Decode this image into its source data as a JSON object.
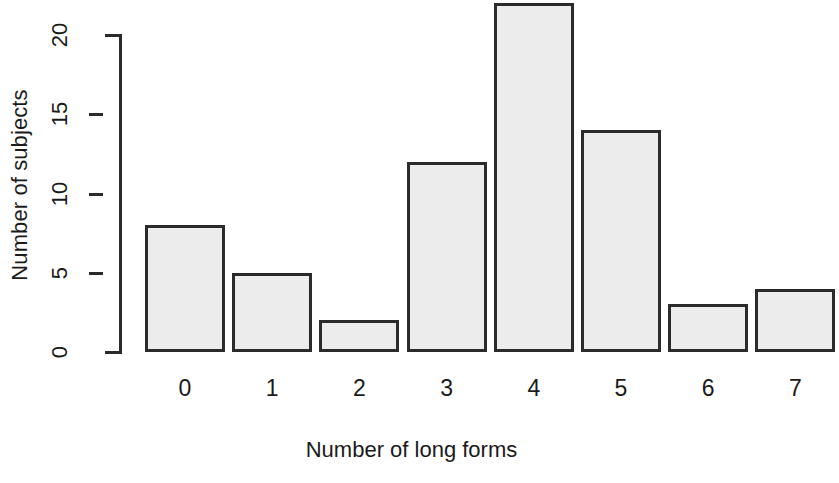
{
  "chart_data": {
    "type": "bar",
    "title": "",
    "subtitle": "",
    "xlabel": "Number of long forms",
    "ylabel": "Number of subjects",
    "categories": [
      "0",
      "1",
      "2",
      "3",
      "4",
      "5",
      "6",
      "7"
    ],
    "values": [
      8,
      5,
      2,
      12,
      22,
      14,
      3,
      4
    ],
    "series": [
      {
        "name": "Number of subjects",
        "values": [
          8,
          5,
          2,
          12,
          22,
          14,
          3,
          4
        ]
      }
    ],
    "ylim": [
      0,
      22
    ],
    "y_ticks": [
      0,
      5,
      10,
      15,
      20
    ],
    "y_tick_labels": [
      "0",
      "5",
      "10",
      "15",
      "20"
    ],
    "x_tick_labels": [
      "0",
      "1",
      "2",
      "3",
      "4",
      "5",
      "6",
      "7"
    ],
    "grid": false,
    "legend": false,
    "legend_position": "none",
    "bar_fill_color": "#ececec",
    "bar_border_color": "#2b2b2b",
    "axis_color": "#2b2b2b",
    "background_color": "#ffffff"
  },
  "axes": {
    "y": {
      "title": "Number of subjects",
      "ticks": [
        {
          "label": "0",
          "value": 0
        },
        {
          "label": "5",
          "value": 5
        },
        {
          "label": "10",
          "value": 10
        },
        {
          "label": "15",
          "value": 15
        },
        {
          "label": "20",
          "value": 20
        }
      ]
    },
    "x": {
      "title": "Number of long forms",
      "ticks": [
        {
          "label": "0",
          "value": 0
        },
        {
          "label": "1",
          "value": 1
        },
        {
          "label": "2",
          "value": 2
        },
        {
          "label": "3",
          "value": 3
        },
        {
          "label": "4",
          "value": 4
        },
        {
          "label": "5",
          "value": 5
        },
        {
          "label": "6",
          "value": 6
        },
        {
          "label": "7",
          "value": 7
        }
      ]
    }
  }
}
